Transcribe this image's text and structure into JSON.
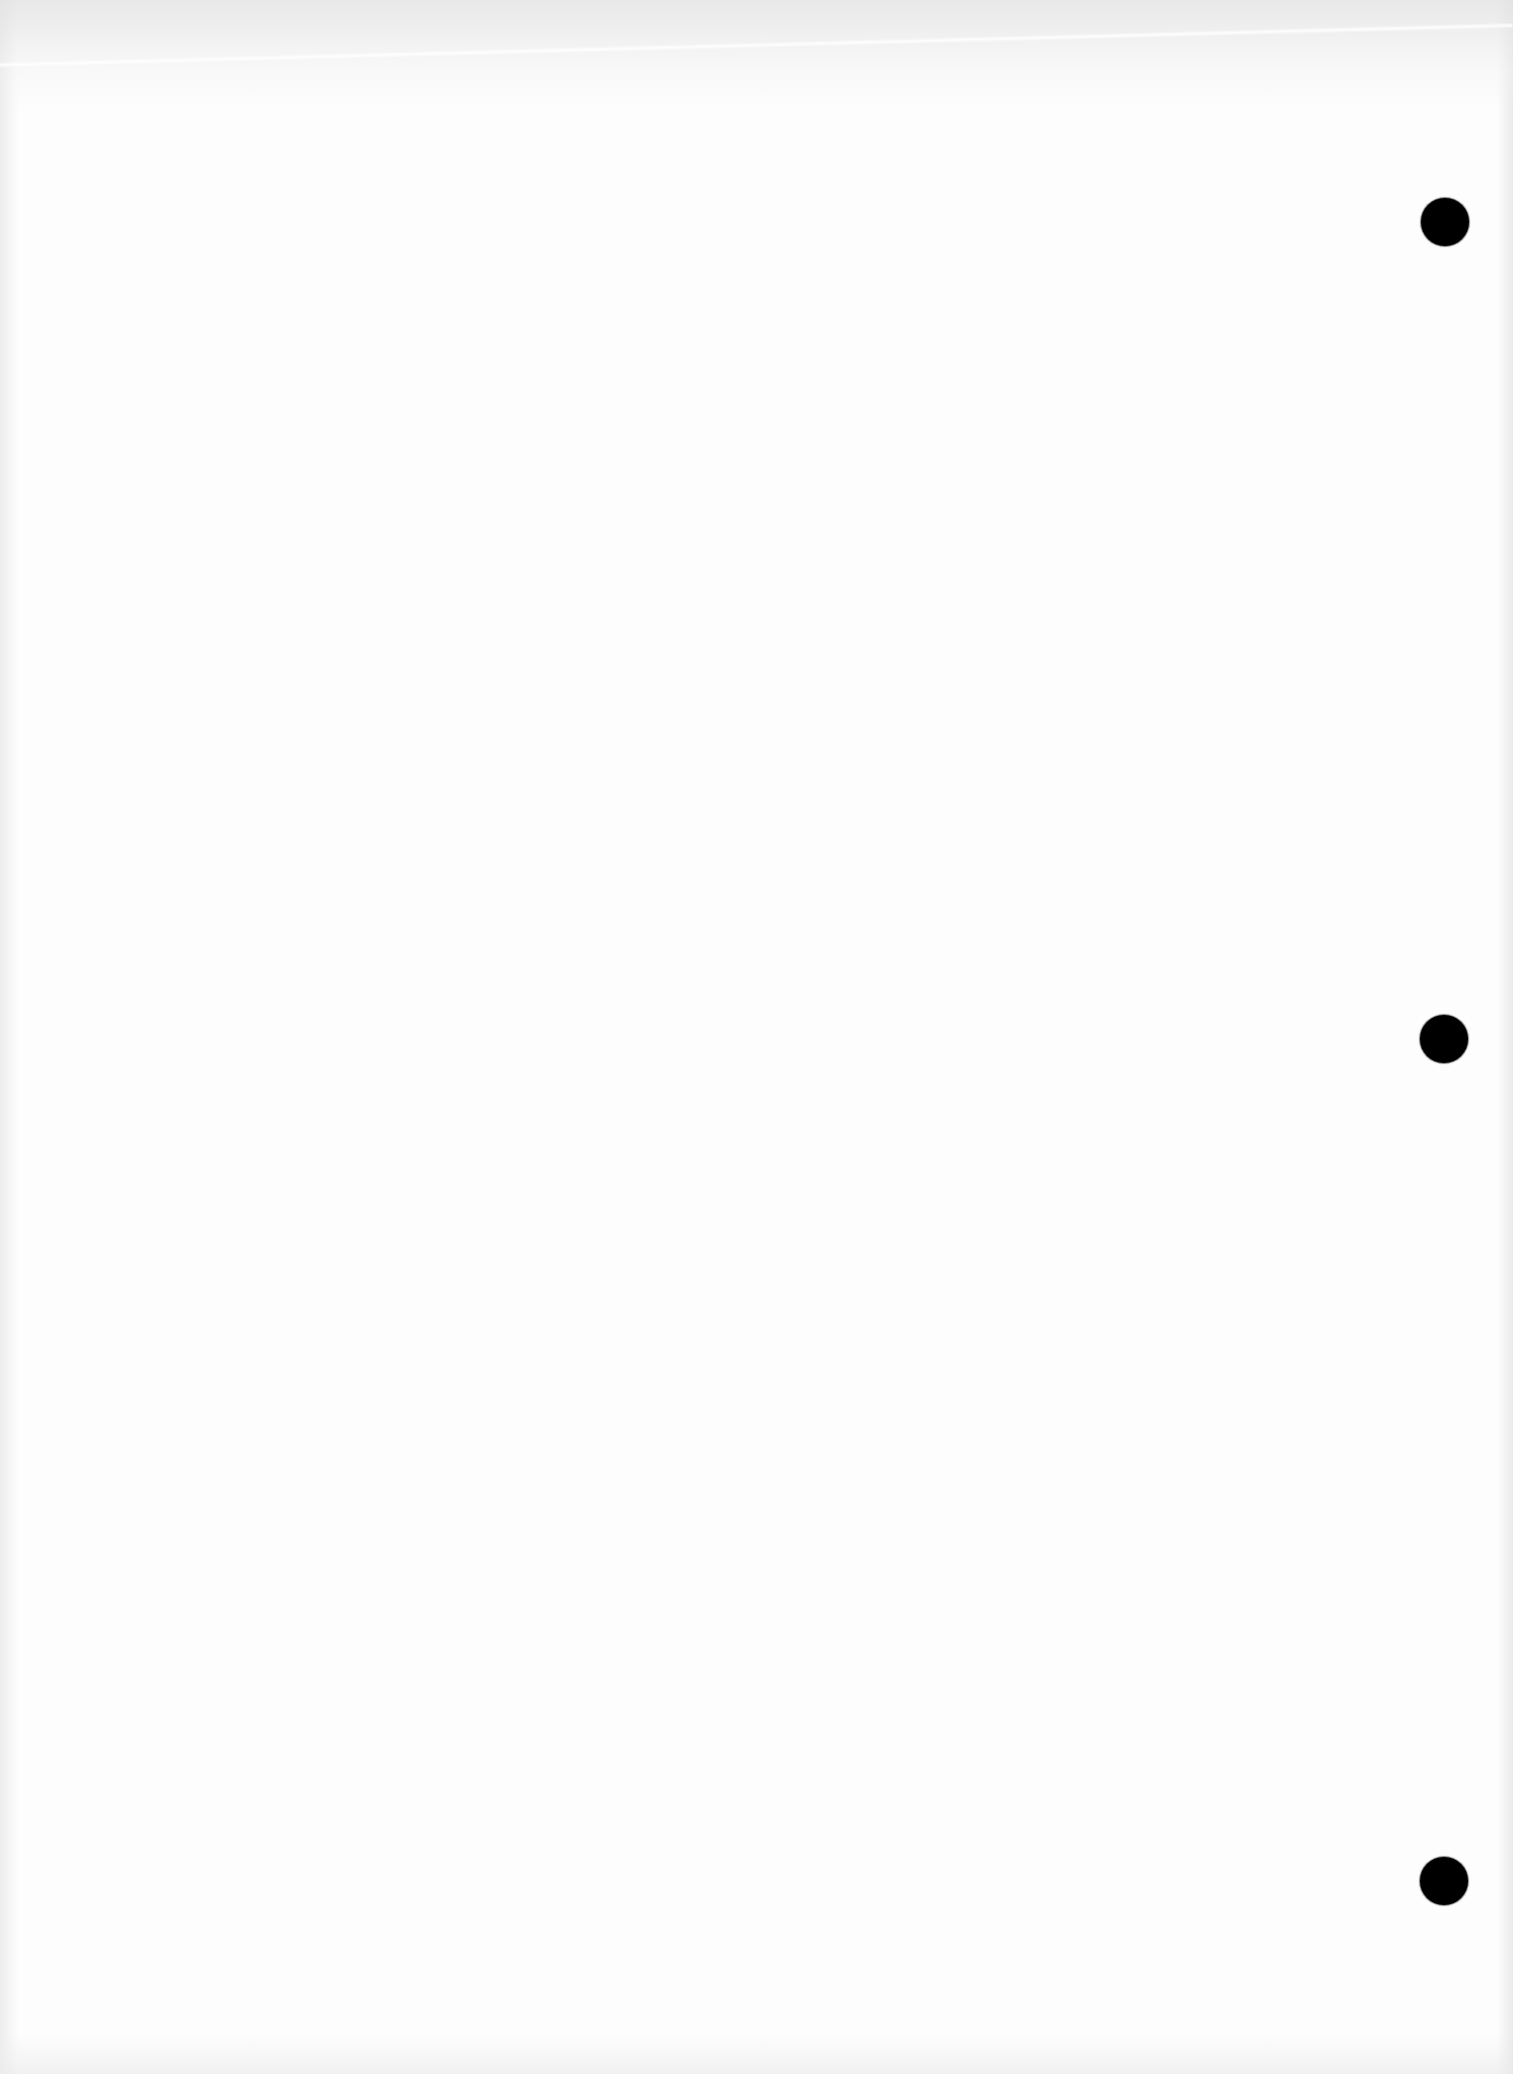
{
  "document": {
    "type": "blank scanned sheet",
    "visible_text": "",
    "background_color": "#fdfdfd",
    "punch_holes": [
      {
        "index": 1,
        "cx": 1445,
        "cy": 222,
        "diameter": 48,
        "color": "#000000"
      },
      {
        "index": 2,
        "cx": 1444,
        "cy": 1039,
        "diameter": 48,
        "color": "#000000"
      },
      {
        "index": 3,
        "cx": 1444,
        "cy": 1881,
        "diameter": 48,
        "color": "#000000"
      }
    ]
  }
}
